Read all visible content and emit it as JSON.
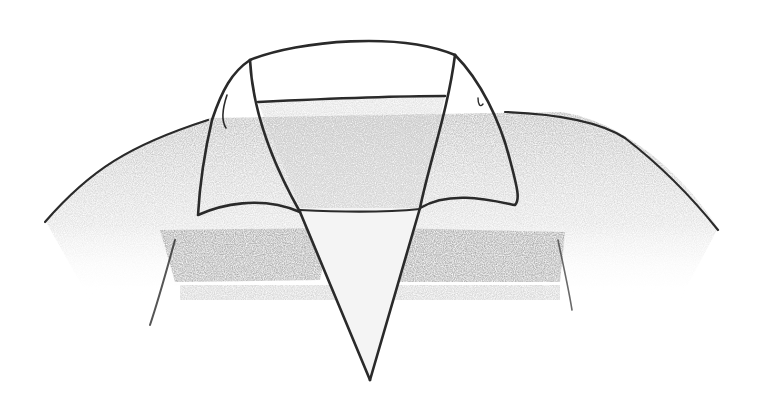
{
  "image": {
    "subject": "pencil sketch of a shirt collar",
    "colors": {
      "background": "#ffffff",
      "line": "#2a2a2a",
      "shade_dark": "#8a8a8a",
      "shade_mid": "#b5b5b5",
      "shade_light": "#d8d8d8"
    }
  }
}
